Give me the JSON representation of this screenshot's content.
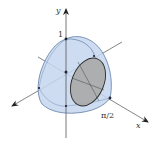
{
  "diagram": {
    "type": "3d-solid-of-revolution",
    "axes": {
      "y_label": "y",
      "x_label": "x"
    },
    "tick_labels": {
      "y_one": "1",
      "x_half_pi": "π/2"
    },
    "colors": {
      "solid_fill": "#c4d6ee",
      "solid_stroke": "#4d6f9c",
      "cross_section_fill": "#a9a9a9",
      "cross_section_stroke": "#2b2b2b",
      "axis": "#555555",
      "background": "#ffffff"
    }
  }
}
